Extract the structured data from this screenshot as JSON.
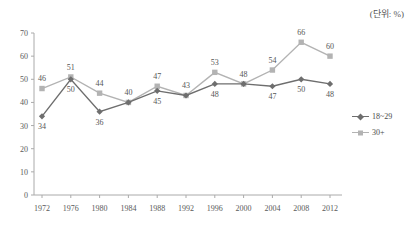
{
  "unit_note": "(단위: %)",
  "legend": {
    "items": [
      {
        "label": "18~29",
        "color": "#6e6e6e",
        "marker": "diamond"
      },
      {
        "label": "30+",
        "color": "#b3b3b3",
        "marker": "square"
      }
    ]
  },
  "chart_data": {
    "type": "line",
    "title": "",
    "subtitle": "",
    "xlabel": "",
    "ylabel": "",
    "unit": "%",
    "grid": false,
    "legend_position": "right",
    "xlim": [
      1972,
      2012
    ],
    "ylim": [
      0,
      70
    ],
    "ytick_labels": [
      "0",
      "10",
      "20",
      "30",
      "40",
      "50",
      "60",
      "70"
    ],
    "yticks": [
      0,
      10,
      20,
      30,
      40,
      50,
      60,
      70
    ],
    "categories": [
      1972,
      1976,
      1980,
      1984,
      1988,
      1992,
      1996,
      2000,
      2004,
      2008,
      2012
    ],
    "xtick_labels": [
      "1972",
      "1976",
      "1980",
      "1984",
      "1988",
      "1992",
      "1996",
      "2000",
      "2004",
      "2008",
      "2012"
    ],
    "series": [
      {
        "name": "18~29",
        "color": "#6e6e6e",
        "marker": "diamond",
        "values": [
          34,
          50,
          36,
          40,
          45,
          43,
          48,
          48,
          47,
          50,
          48
        ],
        "point_labels": [
          "34",
          "50",
          "36",
          "",
          "45",
          "",
          "48",
          "",
          "47",
          "50",
          "48"
        ]
      },
      {
        "name": "30+",
        "color": "#b3b3b3",
        "marker": "square",
        "values": [
          46,
          51,
          44,
          40,
          47,
          43,
          53,
          48,
          54,
          66,
          60
        ],
        "point_labels": [
          "46",
          "51",
          "44",
          "40",
          "47",
          "43",
          "53",
          "48",
          "54",
          "66",
          "60"
        ]
      }
    ]
  }
}
